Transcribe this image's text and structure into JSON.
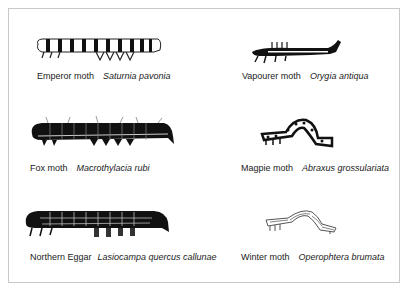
{
  "figure": {
    "specimens": [
      {
        "common": "Emperor moth",
        "latin": "Saturnia pavonia",
        "icon": "emperor-moth-caterpillar-icon"
      },
      {
        "common": "Vapourer moth",
        "latin": "Orygia antiqua",
        "icon": "vapourer-moth-caterpillar-icon"
      },
      {
        "common": "Fox moth",
        "latin": "Macrothylacia rubi",
        "icon": "fox-moth-caterpillar-icon"
      },
      {
        "common": "Magpie moth",
        "latin": "Abraxus grossulariata",
        "icon": "magpie-moth-caterpillar-icon"
      },
      {
        "common": "Northern Eggar",
        "latin": "Lasiocampa quercus callunae",
        "icon": "northern-eggar-caterpillar-icon"
      },
      {
        "common": "Winter moth",
        "latin": "Operophtera brumata",
        "icon": "winter-moth-caterpillar-icon"
      }
    ]
  }
}
